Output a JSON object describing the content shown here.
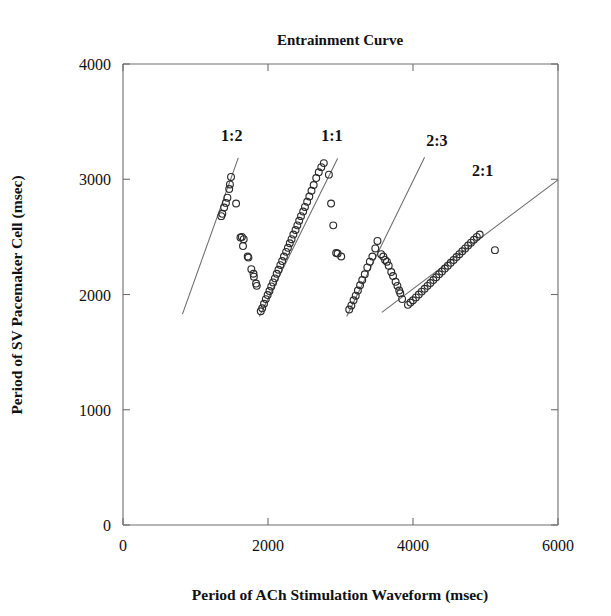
{
  "chart_data": {
    "type": "scatter",
    "title": "Entrainment Curve",
    "xlabel": "Period of ACh Stimulation Waveform (msec)",
    "ylabel": "Period of SV Pacemaker Cell (msec)",
    "xlim": [
      0,
      6000
    ],
    "ylim": [
      0,
      4000
    ],
    "xticks": [
      0,
      2000,
      4000,
      6000
    ],
    "yticks": [
      0,
      1000,
      2000,
      3000,
      4000
    ],
    "xtick_labels": [
      "0",
      "2000",
      "4000",
      "6000"
    ],
    "ytick_labels": [
      "0",
      "1000",
      "2000",
      "3000",
      "4000"
    ],
    "grid": false,
    "legend": "none",
    "marker": "open-circle",
    "annotations": [
      {
        "text": "1:2",
        "x": 1500,
        "y": 3330
      },
      {
        "text": "1:1",
        "x": 2880,
        "y": 3330
      },
      {
        "text": "2:3",
        "x": 4330,
        "y": 3290
      },
      {
        "text": "2:1",
        "x": 4960,
        "y": 3030
      }
    ],
    "fit_lines": [
      {
        "name": "1:2",
        "x0": 820,
        "y0": 1830,
        "x1": 1590,
        "y1": 3185
      },
      {
        "name": "1:1",
        "x0": 1880,
        "y0": 1810,
        "x1": 2960,
        "y1": 3180
      },
      {
        "name": "2:3",
        "x0": 3085,
        "y0": 1810,
        "x1": 4160,
        "y1": 3190
      },
      {
        "name": "2:1",
        "x0": 3570,
        "y0": 1845,
        "x1": 6000,
        "y1": 2995
      }
    ],
    "series": [
      {
        "name": "1:2 entrainment branch",
        "points": [
          [
            1355,
            2680
          ],
          [
            1370,
            2700
          ],
          [
            1395,
            2755
          ],
          [
            1420,
            2795
          ],
          [
            1440,
            2840
          ],
          [
            1465,
            2915
          ],
          [
            1475,
            2955
          ],
          [
            1490,
            3020
          ],
          [
            1560,
            2790
          ]
        ]
      },
      {
        "name": "1:2 descending branch",
        "points": [
          [
            1620,
            2495
          ],
          [
            1640,
            2500
          ],
          [
            1665,
            2480
          ],
          [
            1655,
            2420
          ],
          [
            1720,
            2330
          ],
          [
            1730,
            2320
          ],
          [
            1770,
            2220
          ],
          [
            1800,
            2180
          ],
          [
            1805,
            2155
          ],
          [
            1835,
            2095
          ],
          [
            1845,
            2075
          ]
        ]
      },
      {
        "name": "1:1 entrainment branch",
        "points": [
          [
            1900,
            1855
          ],
          [
            1920,
            1880
          ],
          [
            1945,
            1920
          ],
          [
            1970,
            1960
          ],
          [
            1995,
            1995
          ],
          [
            2020,
            2030
          ],
          [
            2045,
            2070
          ],
          [
            2070,
            2105
          ],
          [
            2095,
            2140
          ],
          [
            2120,
            2180
          ],
          [
            2145,
            2215
          ],
          [
            2170,
            2255
          ],
          [
            2195,
            2290
          ],
          [
            2220,
            2330
          ],
          [
            2250,
            2370
          ],
          [
            2275,
            2405
          ],
          [
            2300,
            2445
          ],
          [
            2325,
            2480
          ],
          [
            2350,
            2520
          ],
          [
            2380,
            2560
          ],
          [
            2405,
            2600
          ],
          [
            2430,
            2640
          ],
          [
            2455,
            2680
          ],
          [
            2485,
            2720
          ],
          [
            2510,
            2760
          ],
          [
            2540,
            2805
          ],
          [
            2570,
            2850
          ],
          [
            2600,
            2900
          ],
          [
            2630,
            2950
          ],
          [
            2665,
            3010
          ],
          [
            2700,
            3060
          ],
          [
            2735,
            3105
          ],
          [
            2770,
            3140
          ]
        ]
      },
      {
        "name": "1:1 descending branch",
        "points": [
          [
            2840,
            3040
          ],
          [
            2870,
            2790
          ],
          [
            2900,
            2600
          ],
          [
            2940,
            2360
          ],
          [
            2960,
            2355
          ],
          [
            3010,
            2330
          ]
        ]
      },
      {
        "name": "2:3 entrainment branch",
        "points": [
          [
            3120,
            1870
          ],
          [
            3150,
            1905
          ],
          [
            3180,
            1950
          ],
          [
            3210,
            1990
          ],
          [
            3240,
            2035
          ],
          [
            3270,
            2080
          ],
          [
            3300,
            2125
          ],
          [
            3335,
            2175
          ],
          [
            3370,
            2235
          ],
          [
            3405,
            2285
          ],
          [
            3440,
            2330
          ],
          [
            3480,
            2400
          ],
          [
            3510,
            2465
          ]
        ]
      },
      {
        "name": "2:3 descending branch",
        "points": [
          [
            3560,
            2350
          ],
          [
            3590,
            2330
          ],
          [
            3615,
            2300
          ],
          [
            3640,
            2285
          ],
          [
            3665,
            2250
          ],
          [
            3700,
            2195
          ],
          [
            3725,
            2160
          ],
          [
            3760,
            2110
          ],
          [
            3785,
            2075
          ],
          [
            3810,
            2035
          ],
          [
            3825,
            2010
          ],
          [
            3850,
            1960
          ]
        ]
      },
      {
        "name": "2:1 entrainment branch",
        "points": [
          [
            3930,
            1910
          ],
          [
            3965,
            1930
          ],
          [
            4000,
            1950
          ],
          [
            4040,
            1975
          ],
          [
            4080,
            2000
          ],
          [
            4120,
            2025
          ],
          [
            4160,
            2050
          ],
          [
            4200,
            2075
          ],
          [
            4240,
            2100
          ],
          [
            4280,
            2125
          ],
          [
            4320,
            2150
          ],
          [
            4360,
            2175
          ],
          [
            4400,
            2200
          ],
          [
            4440,
            2225
          ],
          [
            4480,
            2250
          ],
          [
            4520,
            2275
          ],
          [
            4560,
            2300
          ],
          [
            4600,
            2325
          ],
          [
            4640,
            2350
          ],
          [
            4680,
            2375
          ],
          [
            4720,
            2400
          ],
          [
            4760,
            2425
          ],
          [
            4800,
            2450
          ],
          [
            4840,
            2475
          ],
          [
            4880,
            2500
          ],
          [
            4920,
            2520
          ]
        ]
      },
      {
        "name": "2:1 outlier",
        "points": [
          [
            5130,
            2385
          ]
        ]
      }
    ]
  },
  "figure": {
    "title": "Entrainment Curve",
    "marker_radius_px": 3.4
  }
}
